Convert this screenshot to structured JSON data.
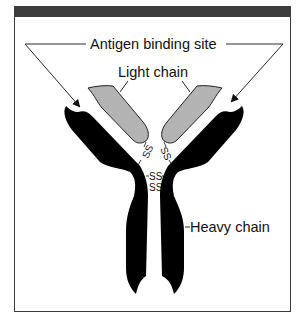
{
  "figure": {
    "labels": {
      "antigen_binding_site": "Antigen binding site",
      "light_chain": "Light chain",
      "heavy_chain": "Heavy chain"
    },
    "disulfide_bonds": {
      "left_arm": "SS",
      "right_arm": "SS",
      "hinge_upper": "SS",
      "hinge_lower": "SS"
    },
    "colors": {
      "heavy_chain": "#000000",
      "light_chain": "#b3b3b3",
      "frame_band": "#3c3c3c",
      "text": "#111111"
    }
  }
}
